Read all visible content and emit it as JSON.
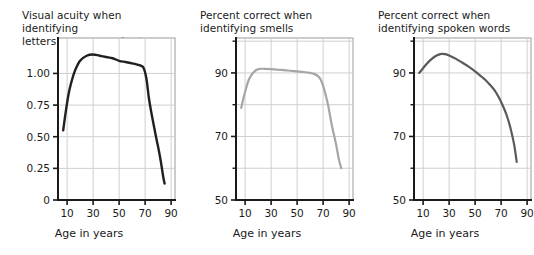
{
  "figure": {
    "width": 534,
    "height": 255,
    "background": "#ffffff",
    "panel_count": 3
  },
  "style": {
    "axis_color": "#1a1a1a",
    "grid_color": "#cfcfcf",
    "frame_color": "#9a9a9a",
    "text_color": "#1a1a1a"
  },
  "chart_data": [
    {
      "type": "line",
      "title": "Visual acuity when identifying\nletters on an eye chart",
      "title_line1": "Visual acuity when identifying",
      "title_line2": "letters on an eye chart",
      "xlabel": "Age in years",
      "ylabel": "",
      "grid": true,
      "legend": "none",
      "line_color": "#231f20",
      "xlim": [
        3,
        93
      ],
      "ylim": [
        0,
        1.28
      ],
      "xticks": [
        10,
        30,
        50,
        70,
        90
      ],
      "xticklabels": [
        "10",
        "30",
        "50",
        "70",
        "90"
      ],
      "yticks": [
        0,
        0.25,
        0.5,
        0.75,
        1.0
      ],
      "yticklabels": [
        "0",
        "0.25",
        "0.50",
        "0.75",
        "1.00"
      ],
      "x": [
        7,
        9,
        11,
        13,
        16,
        20,
        25,
        30,
        35,
        40,
        45,
        50,
        55,
        60,
        64,
        67,
        69,
        71,
        73,
        75,
        78,
        80,
        82,
        84,
        85
      ],
      "y": [
        0.55,
        0.7,
        0.83,
        0.92,
        1.02,
        1.1,
        1.14,
        1.15,
        1.14,
        1.13,
        1.12,
        1.1,
        1.09,
        1.08,
        1.07,
        1.06,
        1.04,
        0.96,
        0.8,
        0.68,
        0.52,
        0.42,
        0.31,
        0.18,
        0.13
      ]
    },
    {
      "type": "line",
      "title": "Percent correct when\nidentifying smells",
      "title_line1": "Percent correct when",
      "title_line2": "identifying smells",
      "xlabel": "Age in years",
      "ylabel": "",
      "grid": true,
      "legend": "none",
      "line_color": "#a6a6a6",
      "xlim": [
        3,
        93
      ],
      "ylim": [
        50,
        101
      ],
      "xticks": [
        10,
        30,
        50,
        70,
        90
      ],
      "xticklabels": [
        "10",
        "30",
        "50",
        "70",
        "90"
      ],
      "yticks": [
        50,
        70,
        90
      ],
      "yticklabels": [
        "50",
        "70",
        "90"
      ],
      "yminorticks": [
        60,
        80,
        100
      ],
      "x": [
        7,
        9,
        11,
        13,
        16,
        20,
        25,
        30,
        35,
        40,
        45,
        50,
        55,
        60,
        63,
        66,
        68,
        70,
        72,
        74,
        77,
        80,
        82,
        84
      ],
      "y": [
        79.0,
        82.5,
        85.5,
        88.0,
        90.0,
        91.2,
        91.3,
        91.2,
        91.0,
        90.9,
        90.7,
        90.5,
        90.3,
        90.0,
        89.7,
        89.0,
        88.0,
        86.0,
        83.0,
        79.5,
        73.0,
        67.5,
        63.0,
        60.0
      ]
    },
    {
      "type": "line",
      "title": "Percent correct when\nidentifying spoken words",
      "title_line1": "Percent correct when",
      "title_line2": "identifying spoken words",
      "xlabel": "Age in years",
      "ylabel": "",
      "grid": true,
      "legend": "none",
      "line_color": "#5a5a5a",
      "xlim": [
        3,
        93
      ],
      "ylim": [
        50,
        101
      ],
      "xticks": [
        10,
        30,
        50,
        70,
        90
      ],
      "xticklabels": [
        "10",
        "30",
        "50",
        "70",
        "90"
      ],
      "yticks": [
        50,
        70,
        90
      ],
      "yticklabels": [
        "50",
        "70",
        "90"
      ],
      "yminorticks": [
        60,
        80,
        100
      ],
      "x": [
        7,
        10,
        13,
        16,
        20,
        24,
        27,
        30,
        35,
        40,
        45,
        50,
        55,
        58,
        62,
        65,
        68,
        71,
        74,
        77,
        80,
        82
      ],
      "y": [
        90.0,
        91.5,
        93.0,
        94.2,
        95.4,
        96.0,
        95.9,
        95.5,
        94.5,
        93.3,
        92.0,
        90.5,
        88.8,
        87.8,
        86.0,
        84.5,
        82.5,
        80.0,
        77.0,
        73.0,
        67.5,
        62.0
      ]
    }
  ]
}
